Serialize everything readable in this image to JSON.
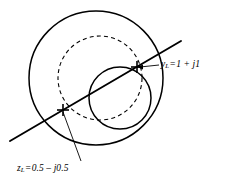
{
  "figure": {
    "kind": "smith-chart-diagram",
    "background_color": "#ffffff",
    "stroke_color": "#000000",
    "annotations": [
      {
        "id": "yl",
        "name": "admittance-label",
        "symbol": "y",
        "subscript": "L",
        "equals": "=",
        "value": "1 + j1",
        "full_text": "yL = 1 + j1",
        "real": 1,
        "imag": 1,
        "marker_x": 137,
        "marker_y": 67
      },
      {
        "id": "zl",
        "name": "impedance-label",
        "symbol": "z",
        "subscript": "L",
        "equals": "=",
        "value": "0.5 – j0.5",
        "full_text": "zL = 0.5 - j0.5",
        "real": 0.5,
        "imag": -0.5,
        "marker_x": 63,
        "marker_y": 110
      }
    ],
    "shapes": [
      {
        "name": "outer-unit-circle",
        "type": "circle",
        "style": "solid",
        "cx": 96,
        "cy": 78,
        "r": 67
      },
      {
        "name": "constant-resistance-circle",
        "type": "circle",
        "style": "solid",
        "cx": 120,
        "cy": 98,
        "r": 31
      },
      {
        "name": "constant-conductance-circle",
        "type": "circle",
        "style": "dashed",
        "cx": 100,
        "cy": 78,
        "r": 42
      },
      {
        "name": "quarter-wave-chord-line",
        "type": "line",
        "style": "solid",
        "x1": 10,
        "y1": 141,
        "x2": 181,
        "y2": 41
      }
    ]
  }
}
